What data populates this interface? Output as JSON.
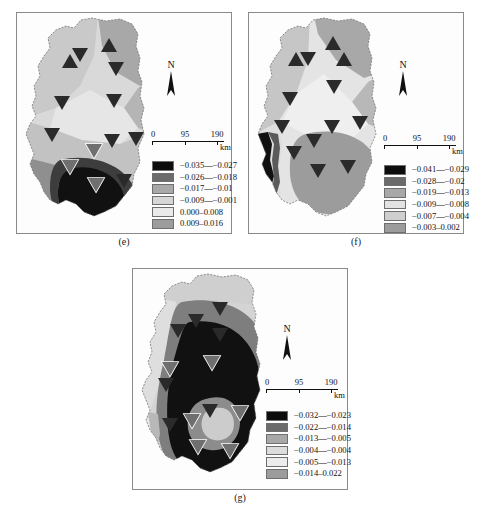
{
  "figure": {
    "background": "#ffffff",
    "panels": [
      {
        "id": "e",
        "caption": "(e)",
        "north_label": "N",
        "scalebar": {
          "ticks": [
            "0",
            "95",
            "190"
          ],
          "unit": "km"
        },
        "legend": [
          {
            "swatch": "#0d0d0d",
            "label": "−0.035—−0.027"
          },
          {
            "swatch": "#6b6b6b",
            "label": "−0.026—−0.018"
          },
          {
            "swatch": "#a8a8a8",
            "label": "−0.017—−0.01"
          },
          {
            "swatch": "#d6d6d6",
            "label": "−0.009—−0.001"
          },
          {
            "swatch": "#eaeaea",
            "label": "0.000–0.008"
          },
          {
            "swatch": "#9c9c9c",
            "label": "0.009–0.016"
          }
        ]
      },
      {
        "id": "f",
        "caption": "(f)",
        "north_label": "N",
        "scalebar": {
          "ticks": [
            "0",
            "95",
            "190"
          ],
          "unit": "km"
        },
        "legend": [
          {
            "swatch": "#0d0d0d",
            "label": "−0.041—−0.029"
          },
          {
            "swatch": "#6b6b6b",
            "label": "−0.028—−0.02"
          },
          {
            "swatch": "#a8a8a8",
            "label": "−0.019—−0.013"
          },
          {
            "swatch": "#e2e2e2",
            "label": "−0.009—−0.008"
          },
          {
            "swatch": "#cfcfcf",
            "label": "−0.007—−0.004"
          },
          {
            "swatch": "#9c9c9c",
            "label": "−0.003–0.002"
          }
        ]
      },
      {
        "id": "g",
        "caption": "(g)",
        "north_label": "N",
        "scalebar": {
          "ticks": [
            "0",
            "95",
            "190"
          ],
          "unit": "km"
        },
        "legend": [
          {
            "swatch": "#0d0d0d",
            "label": "−0.032—−0.023"
          },
          {
            "swatch": "#6b6b6b",
            "label": "−0.022—−0.014"
          },
          {
            "swatch": "#a8a8a8",
            "label": "−0.013—−0.005"
          },
          {
            "swatch": "#dcdcdc",
            "label": "−0.004—−0.004"
          },
          {
            "swatch": "#ececec",
            "label": "−0.005—−0.013"
          },
          {
            "swatch": "#9c9c9c",
            "label": "−0.014–0.022"
          }
        ]
      }
    ]
  }
}
